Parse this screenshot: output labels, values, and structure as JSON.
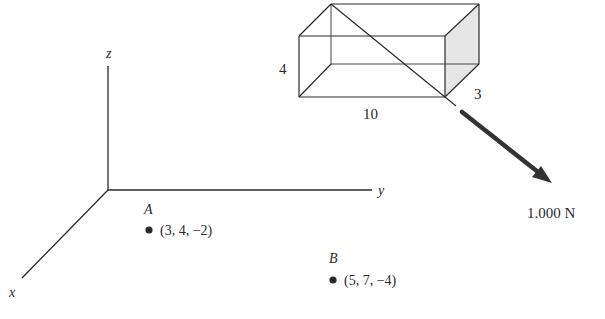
{
  "diagram": {
    "type": "3d-vector-statics",
    "axes": {
      "x_label": "x",
      "y_label": "y",
      "z_label": "z"
    },
    "box": {
      "height_label": "4",
      "length_label": "10",
      "depth_label": "3"
    },
    "force": {
      "label": "1.000 N"
    },
    "points": [
      {
        "name": "A",
        "coords": "(3, 4, −2)"
      },
      {
        "name": "B",
        "coords": "(5, 7, −4)"
      }
    ],
    "colors": {
      "line": "#2a2a2a",
      "face_shade": "#e6e6e6",
      "arrow": "#333333"
    }
  }
}
